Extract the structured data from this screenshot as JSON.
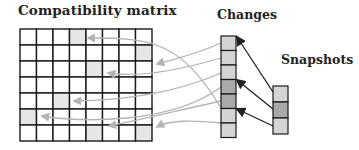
{
  "labels": {
    "matrix": "Compatibility matrix",
    "changes": "Changes",
    "snapshots": "Snapshots"
  },
  "colors": {
    "grid_line": "#1a1a1a",
    "cell_fill": "#ffffff",
    "matrix_shaded": "#e6e6e6",
    "change_light": "#d4d4d4",
    "change_dark": "#a9a9a9",
    "snapshot_light": "#d4d4d4",
    "snapshot_dark": "#a9a9a9",
    "change_arrow": "#b4b4b4",
    "snapshot_arrow": "#222222"
  },
  "matrix": {
    "columns": 8,
    "rows": 7,
    "x": 20,
    "y": 29,
    "width": 132,
    "height": 112,
    "shaded_cells": [
      [
        0,
        3
      ],
      [
        1,
        7
      ],
      [
        2,
        4
      ],
      [
        4,
        2
      ],
      [
        5,
        0
      ],
      [
        6,
        4
      ],
      [
        6,
        7
      ]
    ]
  },
  "changes": {
    "x": 221,
    "y": 36,
    "width": 15,
    "cell_height": 14.5,
    "cells": [
      "light",
      "light",
      "light",
      "dark",
      "dark",
      "light",
      "light"
    ]
  },
  "snapshots": {
    "x": 273,
    "y": 86,
    "width": 15,
    "cell_height": 16,
    "cells": [
      "light",
      "dark",
      "light"
    ]
  },
  "change_arrows": [
    {
      "from": [
        221,
        108
      ],
      "c1": [
        180,
        40
      ],
      "c2": [
        150,
        38
      ],
      "to": [
        88,
        38
      ]
    },
    {
      "from": [
        221,
        43
      ],
      "c1": [
        195,
        55
      ],
      "c2": [
        170,
        60
      ],
      "to": [
        157,
        64
      ]
    },
    {
      "from": [
        221,
        58
      ],
      "c1": [
        180,
        70
      ],
      "c2": [
        140,
        78
      ],
      "to": [
        108,
        73
      ]
    },
    {
      "from": [
        221,
        73
      ],
      "c1": [
        170,
        95
      ],
      "c2": [
        120,
        100
      ],
      "to": [
        74,
        101
      ]
    },
    {
      "from": [
        221,
        87
      ],
      "c1": [
        170,
        125
      ],
      "c2": [
        80,
        122
      ],
      "to": [
        42,
        116
      ]
    },
    {
      "from": [
        221,
        101
      ],
      "c1": [
        180,
        110
      ],
      "c2": [
        140,
        120
      ],
      "to": [
        109,
        126
      ]
    },
    {
      "from": [
        221,
        123
      ],
      "c1": [
        190,
        120
      ],
      "c2": [
        170,
        120
      ],
      "to": [
        157,
        127
      ]
    }
  ],
  "snapshot_arrows": [
    {
      "from": [
        273,
        92
      ],
      "to": [
        237,
        37
      ]
    },
    {
      "from": [
        273,
        109
      ],
      "to": [
        237,
        80
      ]
    },
    {
      "from": [
        273,
        126
      ],
      "to": [
        237,
        109
      ]
    }
  ]
}
